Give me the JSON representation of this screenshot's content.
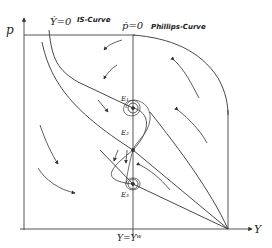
{
  "diagram": {
    "axes": {
      "y_label": "p",
      "x_label": "Y"
    },
    "curves": {
      "is_curve": {
        "equation": "Ẏ=0",
        "name": "IS-Curve"
      },
      "phillips_curve": {
        "equation": "ṗ=0",
        "name": "Phillips-Curve"
      }
    },
    "vertical_line_label": "Y=Yʷ",
    "equilibria": [
      {
        "id": "E1",
        "label": "E₁"
      },
      {
        "id": "E2",
        "label": "E₂"
      },
      {
        "id": "E3",
        "label": "E₃"
      }
    ],
    "colors": {
      "line": "#333333",
      "background": "#ffffff"
    }
  }
}
